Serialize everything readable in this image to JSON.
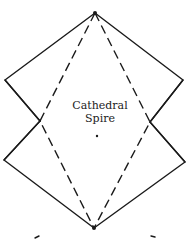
{
  "diagram": {
    "label": {
      "line1": "Cathedral",
      "line2": "Spire"
    },
    "points": {
      "top_apex": [
        95,
        13
      ],
      "upper_left_corner": [
        5,
        80
      ],
      "upper_right_corner": [
        183,
        80
      ],
      "left_crossing": [
        40,
        121
      ],
      "right_crossing": [
        150,
        122
      ],
      "lower_left_corner": [
        4,
        160
      ],
      "lower_right_corner": [
        185,
        162
      ],
      "bottom_apex": [
        94,
        228
      ],
      "center_dot": [
        97,
        136
      ]
    },
    "colors": {
      "line": "#1a1a1a",
      "background": "#ffffff"
    }
  }
}
